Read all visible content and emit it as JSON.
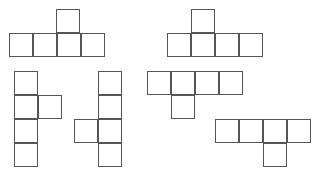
{
  "canvas": {
    "width": 325,
    "height": 175,
    "background_color": "#ffffff",
    "stroke_color": "#555555",
    "stroke_width": 1,
    "cell_size": 24
  },
  "figure": {
    "title": "",
    "shape_count": 6
  },
  "shapes": [
    {
      "id": "shape-1",
      "name": "row-of-four-with-bump-on-third",
      "cell_count": 5,
      "origin": {
        "x": 9,
        "y": 9
      },
      "cells": [
        {
          "x": 56,
          "y": 9,
          "w": 24,
          "h": 24
        },
        {
          "x": 9,
          "y": 33,
          "w": 24,
          "h": 24
        },
        {
          "x": 33,
          "y": 33,
          "w": 24,
          "h": 24
        },
        {
          "x": 57,
          "y": 33,
          "w": 24,
          "h": 24
        },
        {
          "x": 81,
          "y": 33,
          "w": 24,
          "h": 24
        }
      ]
    },
    {
      "id": "shape-2",
      "name": "row-of-four-with-bump-on-second",
      "cell_count": 5,
      "origin": {
        "x": 167,
        "y": 9
      },
      "cells": [
        {
          "x": 191,
          "y": 9,
          "w": 24,
          "h": 24
        },
        {
          "x": 167,
          "y": 33,
          "w": 24,
          "h": 24
        },
        {
          "x": 191,
          "y": 33,
          "w": 24,
          "h": 24
        },
        {
          "x": 215,
          "y": 33,
          "w": 24,
          "h": 24
        },
        {
          "x": 239,
          "y": 33,
          "w": 24,
          "h": 24
        }
      ]
    },
    {
      "id": "shape-3",
      "name": "column-of-four-with-bump-right-on-second",
      "cell_count": 5,
      "origin": {
        "x": 14,
        "y": 71
      },
      "cells": [
        {
          "x": 14,
          "y": 71,
          "w": 24,
          "h": 24
        },
        {
          "x": 14,
          "y": 95,
          "w": 24,
          "h": 24
        },
        {
          "x": 38,
          "y": 95,
          "w": 24,
          "h": 24
        },
        {
          "x": 14,
          "y": 119,
          "w": 24,
          "h": 24
        },
        {
          "x": 14,
          "y": 143,
          "w": 24,
          "h": 24
        }
      ]
    },
    {
      "id": "shape-4",
      "name": "column-of-four-with-bump-left-on-third",
      "cell_count": 5,
      "origin": {
        "x": 74,
        "y": 71
      },
      "cells": [
        {
          "x": 98,
          "y": 71,
          "w": 24,
          "h": 24
        },
        {
          "x": 98,
          "y": 95,
          "w": 24,
          "h": 24
        },
        {
          "x": 74,
          "y": 119,
          "w": 24,
          "h": 24
        },
        {
          "x": 98,
          "y": 119,
          "w": 24,
          "h": 24
        },
        {
          "x": 98,
          "y": 143,
          "w": 24,
          "h": 24
        }
      ]
    },
    {
      "id": "shape-5",
      "name": "row-of-four-with-drop-on-second",
      "cell_count": 5,
      "origin": {
        "x": 147,
        "y": 71
      },
      "cells": [
        {
          "x": 147,
          "y": 71,
          "w": 24,
          "h": 24
        },
        {
          "x": 171,
          "y": 71,
          "w": 24,
          "h": 24
        },
        {
          "x": 195,
          "y": 71,
          "w": 24,
          "h": 24
        },
        {
          "x": 219,
          "y": 71,
          "w": 24,
          "h": 24
        },
        {
          "x": 171,
          "y": 95,
          "w": 24,
          "h": 24
        }
      ]
    },
    {
      "id": "shape-6",
      "name": "row-of-four-with-drop-on-third",
      "cell_count": 5,
      "origin": {
        "x": 215,
        "y": 119
      },
      "cells": [
        {
          "x": 215,
          "y": 119,
          "w": 24,
          "h": 24
        },
        {
          "x": 239,
          "y": 119,
          "w": 24,
          "h": 24
        },
        {
          "x": 263,
          "y": 119,
          "w": 24,
          "h": 24
        },
        {
          "x": 287,
          "y": 119,
          "w": 24,
          "h": 24
        },
        {
          "x": 263,
          "y": 143,
          "w": 24,
          "h": 24
        }
      ]
    }
  ]
}
